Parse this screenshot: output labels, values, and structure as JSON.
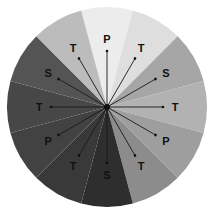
{
  "diagram": {
    "center": [
      107,
      107
    ],
    "radius": 100,
    "sectors": [
      {
        "label": "P",
        "color": "#ececec"
      },
      {
        "label": "T",
        "color": "#dedede"
      },
      {
        "label": "S",
        "color": "#a6a6a6"
      },
      {
        "label": "T",
        "color": "#b2b2b2"
      },
      {
        "label": "P",
        "color": "#9e9e9e"
      },
      {
        "label": "T",
        "color": "#8c8c8c"
      },
      {
        "label": "S",
        "color": "#2e2e2e"
      },
      {
        "label": "T",
        "color": "#393939"
      },
      {
        "label": "P",
        "color": "#424242"
      },
      {
        "label": "T",
        "color": "#474747"
      },
      {
        "label": "S",
        "color": "#545454"
      },
      {
        "label": "T",
        "color": "#bcbcbc"
      }
    ]
  }
}
